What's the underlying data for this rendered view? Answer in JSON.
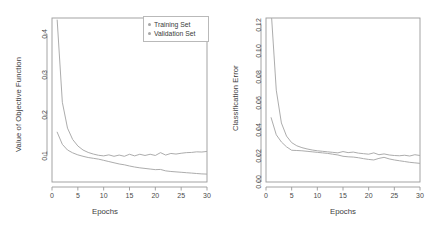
{
  "figure": {
    "panels": [
      "objective",
      "error"
    ]
  },
  "legend": {
    "position": "top-right-of-left-panel",
    "entries": [
      {
        "label": "Training Set",
        "color": "#a6a6a6",
        "marker": "dot"
      },
      {
        "label": "Validation Set",
        "color": "#a6a6a6",
        "marker": "dot"
      }
    ]
  },
  "colors": {
    "line": "#a8a8a8",
    "axis": "#9a9a9a",
    "text": "#3a3a3a",
    "background": "#ffffff"
  },
  "chart_data": [
    {
      "type": "line",
      "title": "",
      "xlabel": "Epochs",
      "ylabel": "Value of Objective Function",
      "xlim": [
        0,
        30
      ],
      "ylim": [
        0.035,
        0.44
      ],
      "xticks": [
        0,
        5,
        10,
        15,
        20,
        25,
        30
      ],
      "xtick_labels": [
        "0",
        "5",
        "10",
        "15",
        "20",
        "25",
        "30"
      ],
      "yticks": [
        0.1,
        0.2,
        0.3,
        0.4
      ],
      "ytick_labels": [
        "0.1",
        "0.2",
        "0.3",
        "0.4"
      ],
      "grid": false,
      "legend_position": "top right",
      "x": [
        1,
        2,
        3,
        4,
        5,
        6,
        7,
        8,
        9,
        10,
        11,
        12,
        13,
        14,
        15,
        16,
        17,
        18,
        19,
        20,
        21,
        22,
        23,
        24,
        25,
        26,
        27,
        28,
        29,
        30
      ],
      "series": [
        {
          "name": "Training Set",
          "color": "#a8a8a8",
          "values": [
            0.158,
            0.128,
            0.114,
            0.107,
            0.102,
            0.0985,
            0.0955,
            0.0935,
            0.0915,
            0.0885,
            0.0855,
            0.0825,
            0.0795,
            0.0775,
            0.0745,
            0.072,
            0.07,
            0.0685,
            0.067,
            0.0655,
            0.066,
            0.0625,
            0.061,
            0.06,
            0.059,
            0.058,
            0.057,
            0.056,
            0.055,
            0.0545
          ]
        },
        {
          "name": "Validation Set",
          "color": "#a8a8a8",
          "values": [
            0.435,
            0.232,
            0.168,
            0.14,
            0.124,
            0.114,
            0.108,
            0.104,
            0.101,
            0.0995,
            0.102,
            0.0985,
            0.1015,
            0.0985,
            0.1035,
            0.0995,
            0.1035,
            0.1005,
            0.1035,
            0.1005,
            0.1075,
            0.1015,
            0.1055,
            0.104,
            0.106,
            0.1075,
            0.108,
            0.1095,
            0.109,
            0.1105
          ]
        }
      ]
    },
    {
      "type": "line",
      "title": "",
      "xlabel": "Epochs",
      "ylabel": "Classification Error",
      "xlim": [
        0,
        30
      ],
      "ylim": [
        0.0,
        0.125
      ],
      "xticks": [
        0,
        5,
        10,
        15,
        20,
        25,
        30
      ],
      "xtick_labels": [
        "0",
        "5",
        "10",
        "15",
        "20",
        "25",
        "30"
      ],
      "yticks": [
        0.0,
        0.02,
        0.04,
        0.06,
        0.08,
        0.1,
        0.12
      ],
      "ytick_labels": [
        "0.00",
        "0.02",
        "0.04",
        "0.06",
        "0.08",
        "0.10",
        "0.12"
      ],
      "grid": false,
      "legend_position": "none",
      "x": [
        1,
        2,
        3,
        4,
        5,
        6,
        7,
        8,
        9,
        10,
        11,
        12,
        13,
        14,
        15,
        16,
        17,
        18,
        19,
        20,
        21,
        22,
        23,
        24,
        25,
        26,
        27,
        28,
        29,
        30
      ],
      "series": [
        {
          "name": "Training Set",
          "color": "#a8a8a8",
          "values": [
            0.049,
            0.036,
            0.0305,
            0.0268,
            0.0242,
            0.024,
            0.0238,
            0.0234,
            0.023,
            0.0226,
            0.0222,
            0.0218,
            0.0212,
            0.0206,
            0.0196,
            0.0192,
            0.019,
            0.0185,
            0.0178,
            0.0172,
            0.0168,
            0.018,
            0.0188,
            0.0176,
            0.0168,
            0.0162,
            0.0156,
            0.015,
            0.0146,
            0.0142
          ]
        },
        {
          "name": "Validation Set",
          "color": "#a8a8a8",
          "values": [
            0.131,
            0.07,
            0.045,
            0.035,
            0.03,
            0.0276,
            0.0262,
            0.0252,
            0.0244,
            0.0238,
            0.0234,
            0.023,
            0.0226,
            0.0222,
            0.0232,
            0.0224,
            0.0228,
            0.022,
            0.0216,
            0.0212,
            0.0222,
            0.0208,
            0.0214,
            0.0206,
            0.0202,
            0.02,
            0.0204,
            0.0198,
            0.0208,
            0.0202
          ]
        }
      ]
    }
  ]
}
